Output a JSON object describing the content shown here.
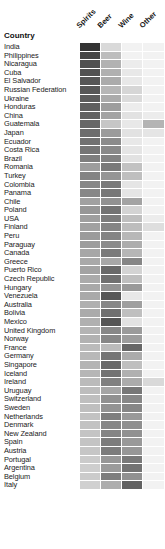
{
  "title_label": "Country",
  "columns": [
    "Spirits",
    "Beer",
    "Wine",
    "Other"
  ],
  "colors": {
    "background": "#ffffff",
    "text": "#1a1a1a",
    "scale_dark": "#3a3a3a",
    "scale_light": "#efefef"
  },
  "chart_data": {
    "type": "heatmap",
    "title": "",
    "xlabel": "",
    "ylabel": "Country",
    "grid": false,
    "legend": "none",
    "x_categories": [
      "Spirits",
      "Beer",
      "Wine",
      "Other"
    ],
    "value_range": [
      0,
      100
    ],
    "value_unit": "percent of recorded alcohol consumption",
    "colormap": "greys",
    "y_categories": [
      "India",
      "Philippines",
      "Nicaragua",
      "Cuba",
      "El Salvador",
      "Russian Federation",
      "Ukraine",
      "Honduras",
      "China",
      "Guatemala",
      "Japan",
      "Ecuador",
      "Costa Rica",
      "Brazil",
      "Romania",
      "Turkey",
      "Colombia",
      "Panama",
      "Chile",
      "Poland",
      "USA",
      "Finland",
      "Peru",
      "Paraguay",
      "Canada",
      "Greece",
      "Puerto Rico",
      "Czech Republic",
      "Hungary",
      "Venezuela",
      "Australia",
      "Bolivia",
      "Mexico",
      "United Kingdom",
      "Norway",
      "France",
      "Germany",
      "Singapore",
      "Iceland",
      "Ireland",
      "Uruguay",
      "Switzerland",
      "Sweden",
      "Netherlands",
      "Denmark",
      "New Zealand",
      "Spain",
      "Austria",
      "Portugal",
      "Argentina",
      "Belgium",
      "Italy"
    ],
    "rows": [
      {
        "country": "India",
        "values": [
          93,
          7,
          0,
          0
        ]
      },
      {
        "country": "Philippines",
        "values": [
          82,
          18,
          0,
          0
        ]
      },
      {
        "country": "Nicaragua",
        "values": [
          76,
          23,
          1,
          0
        ]
      },
      {
        "country": "Cuba",
        "values": [
          74,
          24,
          2,
          0
        ]
      },
      {
        "country": "El Salvador",
        "values": [
          72,
          26,
          2,
          0
        ]
      },
      {
        "country": "Russian Federation",
        "values": [
          71,
          21,
          8,
          0
        ]
      },
      {
        "country": "Ukraine",
        "values": [
          68,
          26,
          6,
          0
        ]
      },
      {
        "country": "Honduras",
        "values": [
          66,
          33,
          1,
          0
        ]
      },
      {
        "country": "China",
        "values": [
          65,
          30,
          4,
          1
        ]
      },
      {
        "country": "Guatemala",
        "values": [
          62,
          14,
          2,
          22
        ]
      },
      {
        "country": "Japan",
        "values": [
          59,
          34,
          4,
          3
        ]
      },
      {
        "country": "Ecuador",
        "values": [
          56,
          42,
          2,
          0
        ]
      },
      {
        "country": "Costa Rica",
        "values": [
          54,
          43,
          3,
          0
        ]
      },
      {
        "country": "Brazil",
        "values": [
          49,
          47,
          4,
          0
        ]
      },
      {
        "country": "Romania",
        "values": [
          33,
          51,
          16,
          0
        ]
      },
      {
        "country": "Turkey",
        "values": [
          46,
          37,
          17,
          0
        ]
      },
      {
        "country": "Colombia",
        "values": [
          45,
          52,
          3,
          0
        ]
      },
      {
        "country": "Panama",
        "values": [
          44,
          53,
          3,
          0
        ]
      },
      {
        "country": "Chile",
        "values": [
          31,
          39,
          30,
          0
        ]
      },
      {
        "country": "Poland",
        "values": [
          36,
          55,
          9,
          0
        ]
      },
      {
        "country": "USA",
        "values": [
          32,
          50,
          17,
          1
        ]
      },
      {
        "country": "Finland",
        "values": [
          31,
          46,
          18,
          5
        ]
      },
      {
        "country": "Peru",
        "values": [
          34,
          46,
          20,
          0
        ]
      },
      {
        "country": "Paraguay",
        "values": [
          33,
          42,
          25,
          0
        ]
      },
      {
        "country": "Canada",
        "values": [
          28,
          51,
          21,
          0
        ]
      },
      {
        "country": "Greece",
        "values": [
          27,
          28,
          45,
          0
        ]
      },
      {
        "country": "Puerto Rico",
        "values": [
          30,
          61,
          9,
          0
        ]
      },
      {
        "country": "Czech Republic",
        "values": [
          26,
          57,
          17,
          0
        ]
      },
      {
        "country": "Hungary",
        "values": [
          27,
          38,
          35,
          0
        ]
      },
      {
        "country": "Venezuela",
        "values": [
          27,
          71,
          2,
          0
        ]
      },
      {
        "country": "Australia",
        "values": [
          24,
          44,
          32,
          0
        ]
      },
      {
        "country": "Bolivia",
        "values": [
          26,
          57,
          17,
          0
        ]
      },
      {
        "country": "Mexico",
        "values": [
          24,
          72,
          4,
          0
        ]
      },
      {
        "country": "United Kingdom",
        "values": [
          22,
          44,
          34,
          0
        ]
      },
      {
        "country": "Norway",
        "values": [
          23,
          44,
          33,
          0
        ]
      },
      {
        "country": "France",
        "values": [
          19,
          19,
          62,
          0
        ]
      },
      {
        "country": "Germany",
        "values": [
          20,
          54,
          26,
          0
        ]
      },
      {
        "country": "Singapore",
        "values": [
          22,
          61,
          17,
          0
        ]
      },
      {
        "country": "Iceland",
        "values": [
          21,
          55,
          24,
          0
        ]
      },
      {
        "country": "Ireland",
        "values": [
          19,
          48,
          26,
          7
        ]
      },
      {
        "country": "Uruguay",
        "values": [
          18,
          29,
          53,
          0
        ]
      },
      {
        "country": "Switzerland",
        "values": [
          17,
          39,
          44,
          0
        ]
      },
      {
        "country": "Sweden",
        "values": [
          17,
          38,
          45,
          0
        ]
      },
      {
        "country": "Netherlands",
        "values": [
          16,
          49,
          35,
          0
        ]
      },
      {
        "country": "Denmark",
        "values": [
          16,
          44,
          40,
          0
        ]
      },
      {
        "country": "New Zealand",
        "values": [
          15,
          46,
          39,
          0
        ]
      },
      {
        "country": "Spain",
        "values": [
          15,
          50,
          35,
          0
        ]
      },
      {
        "country": "Austria",
        "values": [
          14,
          50,
          36,
          0
        ]
      },
      {
        "country": "Portugal",
        "values": [
          12,
          36,
          52,
          0
        ]
      },
      {
        "country": "Argentina",
        "values": [
          11,
          34,
          55,
          0
        ]
      },
      {
        "country": "Belgium",
        "values": [
          12,
          49,
          39,
          0
        ]
      },
      {
        "country": "Italy",
        "values": [
          10,
          25,
          65,
          0
        ]
      }
    ]
  }
}
